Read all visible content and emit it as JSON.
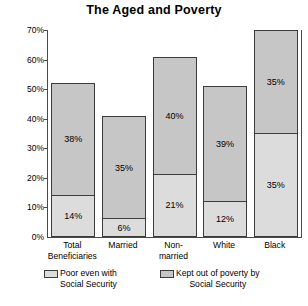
{
  "chart_data": {
    "type": "bar",
    "title": "The Aged and Poverty",
    "xlabel": "",
    "ylabel": "",
    "ylim": [
      0,
      70
    ],
    "ytick_labels": [
      "70%",
      "60%",
      "50%",
      "40%",
      "30%",
      "20%",
      "10%",
      "0%"
    ],
    "ytick_values": [
      70,
      60,
      50,
      40,
      30,
      20,
      10,
      0
    ],
    "grid": false,
    "stacked": true,
    "legend_position": "bottom",
    "categories": [
      "Total Beneficiaries",
      "Married",
      "Non-married",
      "White",
      "Black"
    ],
    "category_lines": [
      [
        "Total",
        "Beneficiaries"
      ],
      [
        "Married"
      ],
      [
        "Non-",
        "married"
      ],
      [
        "White"
      ],
      [
        "Black"
      ]
    ],
    "series": [
      {
        "name": "Poor even with Social Security",
        "name_lines": [
          "Poor even with",
          "Social Security"
        ],
        "color": "#dcdcdc",
        "values": [
          14,
          6,
          21,
          12,
          35
        ],
        "labels": [
          "14%",
          "6%",
          "21%",
          "12%",
          "35%"
        ]
      },
      {
        "name": "Kept out of poverty by Social Security",
        "name_lines": [
          "Kept out of poverty by",
          "Social Security"
        ],
        "color": "#c6c6c6",
        "values": [
          38,
          35,
          40,
          39,
          35
        ],
        "labels": [
          "38%",
          "35%",
          "40%",
          "39%",
          "35%"
        ]
      }
    ],
    "totals": [
      52,
      41,
      61,
      51,
      70
    ]
  },
  "colors": {
    "axis": "#4a4a4a",
    "segment_border": "#3c3c3c",
    "poor": "#dcdcdc",
    "kept_out": "#c6c6c6",
    "text": "#000000",
    "background": "#ffffff"
  }
}
